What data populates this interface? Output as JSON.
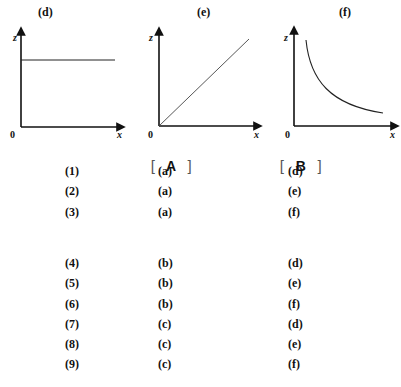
{
  "graphs": [
    {
      "id": "d",
      "title": "(d)",
      "y_axis": "z",
      "x_axis": "x",
      "origin": "0",
      "shape": "horizontal line (constant)"
    },
    {
      "id": "e",
      "title": "(e)",
      "y_axis": "z",
      "x_axis": "x",
      "origin": "0",
      "shape": "straight line through origin (proportional)"
    },
    {
      "id": "f",
      "title": "(f)",
      "y_axis": "z",
      "x_axis": "x",
      "origin": "0",
      "shape": "decreasing curve (inverse)"
    }
  ],
  "table": {
    "headers": {
      "bracket_open": "[",
      "bracket_close": "]",
      "a": "A",
      "b": "B"
    },
    "rows": [
      {
        "num": "(1)",
        "a": "(a)",
        "b": "(d)"
      },
      {
        "num": "(2)",
        "a": "(a)",
        "b": "(e)"
      },
      {
        "num": "(3)",
        "a": "(a)",
        "b": "(f)"
      },
      {
        "num": "(4)",
        "a": "(b)",
        "b": "(d)"
      },
      {
        "num": "(5)",
        "a": "(b)",
        "b": "(e)"
      },
      {
        "num": "(6)",
        "a": "(b)",
        "b": "(f)"
      },
      {
        "num": "(7)",
        "a": "(c)",
        "b": "(d)"
      },
      {
        "num": "(8)",
        "a": "(c)",
        "b": "(e)"
      },
      {
        "num": "(9)",
        "a": "(c)",
        "b": "(f)"
      }
    ]
  }
}
